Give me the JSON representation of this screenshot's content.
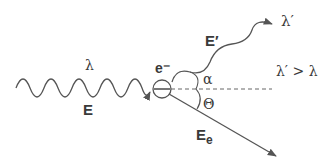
{
  "diagram": {
    "type": "compton-scattering",
    "labels": {
      "incident_wavelength": "λ",
      "incident_energy": "E",
      "electron": "e⁻",
      "scattered_energy": "E′",
      "scattered_wavelength": "λ′",
      "wavelength_relation": "λ′ > λ",
      "photon_angle": "α",
      "electron_angle": "Θ",
      "electron_energy": "E",
      "electron_energy_subscript": "e"
    },
    "colors": {
      "stroke": "#555555",
      "text": "#3a3a3a",
      "background": "#ffffff"
    }
  }
}
